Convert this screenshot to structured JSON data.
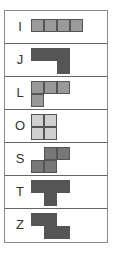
{
  "pieces": [
    {
      "label": "I",
      "color": "#9a9a9a",
      "cells": [
        [
          0,
          0
        ],
        [
          1,
          0
        ],
        [
          2,
          0
        ],
        [
          3,
          0
        ]
      ],
      "offset_y": 4
    },
    {
      "label": "J",
      "color": "#555555",
      "cells": [
        [
          0,
          0
        ],
        [
          1,
          0
        ],
        [
          2,
          0
        ],
        [
          2,
          1
        ]
      ],
      "offset_y": 0
    },
    {
      "label": "L",
      "color": "#999999",
      "cells": [
        [
          0,
          0
        ],
        [
          1,
          0
        ],
        [
          2,
          0
        ],
        [
          0,
          1
        ]
      ],
      "offset_y": 0
    },
    {
      "label": "O",
      "color": "#d0d0d0",
      "cells": [
        [
          0,
          0
        ],
        [
          1,
          0
        ],
        [
          0,
          1
        ],
        [
          1,
          1
        ]
      ],
      "offset_y": 0
    },
    {
      "label": "S",
      "color": "#777777",
      "cells": [
        [
          1,
          0
        ],
        [
          2,
          0
        ],
        [
          0,
          1
        ],
        [
          1,
          1
        ]
      ],
      "offset_y": 0
    },
    {
      "label": "T",
      "color": "#555555",
      "cells": [
        [
          0,
          0
        ],
        [
          1,
          0
        ],
        [
          2,
          0
        ],
        [
          1,
          1
        ]
      ],
      "offset_y": 0
    },
    {
      "label": "Z",
      "color": "#555555",
      "cells": [
        [
          0,
          0
        ],
        [
          1,
          0
        ],
        [
          1,
          1
        ],
        [
          2,
          1
        ]
      ],
      "offset_y": 0
    }
  ]
}
